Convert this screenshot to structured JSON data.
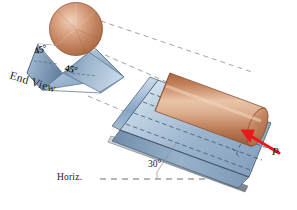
{
  "labels": {
    "angle_left": "45°",
    "angle_right": "45°",
    "end_view": "End View",
    "incline_angle": "30°",
    "horizontal": "Horiz.",
    "force": "P"
  },
  "colors": {
    "cylinder_copper_light": "#e8c2a6",
    "cylinder_copper_mid": "#c98c68",
    "cylinder_copper_dark": "#9a5c3e",
    "block_blue_light": "#e7eef6",
    "block_blue_mid": "#a9c0d6",
    "block_blue_dark": "#5d7c9b",
    "block_edge": "#46566a",
    "force_red": "#e8191c",
    "dash_gray": "#7a7a7a",
    "text": "#1d1d22"
  },
  "geometry": {
    "incline_degrees": 30,
    "vee_half_angle_degrees": 45,
    "force_direction": "up-slope, applied to lower end face of cylinder"
  }
}
